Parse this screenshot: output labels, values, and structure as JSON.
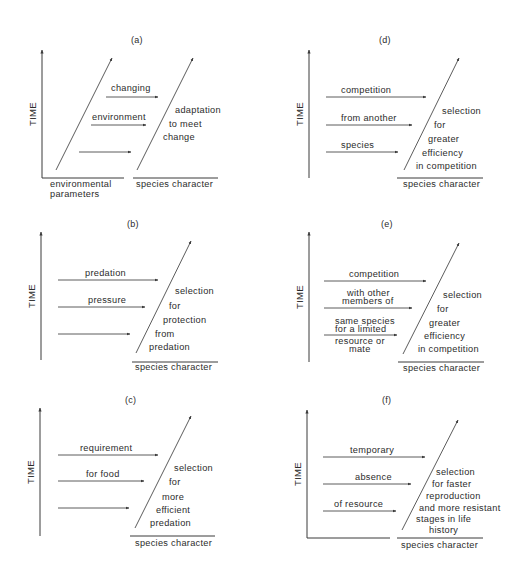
{
  "figure": {
    "panels": [
      {
        "id": "a",
        "label": "(a)",
        "label_pos": [
          131,
          43
        ],
        "axis_label": "TIME",
        "axis": {
          "x": 42,
          "y_top": 50,
          "y_bottom": 178
        },
        "baselines": [
          [
            42,
            178,
            124,
            178
          ],
          [
            133,
            178,
            218,
            178
          ]
        ],
        "diagonals": [
          [
            56,
            170,
            112,
            58
          ],
          [
            137,
            170,
            193,
            58
          ]
        ],
        "arrows": [
          {
            "y": 97,
            "x1": 106,
            "x2": 158,
            "text": "changing",
            "text_x": 111,
            "text_y": 91
          },
          {
            "y": 125,
            "x1": 91,
            "x2": 146,
            "text": "environment",
            "text_x": 92,
            "text_y": 120
          },
          {
            "y": 152,
            "x1": 79,
            "x2": 131,
            "text": "",
            "text_x": 0,
            "text_y": 0
          }
        ],
        "outcome_lines": [
          {
            "text": "adaptation",
            "x": 175,
            "y": 113
          },
          {
            "text": "to meet",
            "x": 169,
            "y": 127
          },
          {
            "text": "change",
            "x": 163,
            "y": 140
          }
        ],
        "x_labels": [
          {
            "text": "environmental",
            "x": 50,
            "y": 187
          },
          {
            "text": "parameters",
            "x": 50,
            "y": 197
          },
          {
            "text": "species character",
            "x": 136,
            "y": 187
          }
        ]
      },
      {
        "id": "b",
        "label": "(b)",
        "label_pos": [
          127,
          227
        ],
        "axis_label": "TIME",
        "axis": {
          "x": 41,
          "y_top": 232,
          "y_bottom": 360
        },
        "baselines": [
          [
            132,
            362,
            218,
            362
          ]
        ],
        "diagonals": [
          [
            136,
            353,
            191,
            241
          ]
        ],
        "arrows": [
          {
            "y": 280,
            "x1": 58,
            "x2": 158,
            "text": "predation",
            "text_x": 85,
            "text_y": 276
          },
          {
            "y": 307,
            "x1": 58,
            "x2": 145,
            "text": "pressure",
            "text_x": 88,
            "text_y": 303
          },
          {
            "y": 334,
            "x1": 58,
            "x2": 130,
            "text": "",
            "text_x": 0,
            "text_y": 0
          }
        ],
        "outcome_lines": [
          {
            "text": "selection",
            "x": 175,
            "y": 294
          },
          {
            "text": "for",
            "x": 169,
            "y": 309
          },
          {
            "text": "protection",
            "x": 163,
            "y": 323
          },
          {
            "text": "from",
            "x": 155,
            "y": 337
          },
          {
            "text": "predation",
            "x": 149,
            "y": 350
          }
        ],
        "x_labels": [
          {
            "text": "species character",
            "x": 135,
            "y": 370
          }
        ]
      },
      {
        "id": "c",
        "label": "(c)",
        "label_pos": [
          125,
          403
        ],
        "axis_label": "TIME",
        "axis": {
          "x": 40,
          "y_top": 408,
          "y_bottom": 536
        },
        "baselines": [
          [
            130,
            536,
            215,
            536
          ]
        ],
        "diagonals": [
          [
            135,
            528,
            191,
            416
          ]
        ],
        "arrows": [
          {
            "y": 455,
            "x1": 58,
            "x2": 158,
            "text": "requirement",
            "text_x": 80,
            "text_y": 451
          },
          {
            "y": 481,
            "x1": 58,
            "x2": 144,
            "text": "for food",
            "text_x": 86,
            "text_y": 477
          },
          {
            "y": 508,
            "x1": 58,
            "x2": 129,
            "text": "",
            "text_x": 0,
            "text_y": 0
          }
        ],
        "outcome_lines": [
          {
            "text": "selection",
            "x": 174,
            "y": 471
          },
          {
            "text": "for",
            "x": 169,
            "y": 485
          },
          {
            "text": "more",
            "x": 162,
            "y": 500
          },
          {
            "text": "efficient",
            "x": 156,
            "y": 513
          },
          {
            "text": "predation",
            "x": 150,
            "y": 526
          }
        ],
        "x_labels": [
          {
            "text": "species character",
            "x": 135,
            "y": 546
          }
        ]
      },
      {
        "id": "d",
        "label": "(d)",
        "label_pos": [
          379,
          43
        ],
        "axis_label": "TIME",
        "axis": {
          "x": 309,
          "y_top": 50,
          "y_bottom": 178
        },
        "baselines": [
          [
            397,
            178,
            483,
            178
          ]
        ],
        "diagonals": [
          [
            404,
            170,
            459,
            58
          ]
        ],
        "arrows": [
          {
            "y": 97,
            "x1": 326,
            "x2": 426,
            "text": "competition",
            "text_x": 341,
            "text_y": 93
          },
          {
            "y": 125,
            "x1": 326,
            "x2": 412,
            "text": "from another",
            "text_x": 341,
            "text_y": 121
          },
          {
            "y": 152,
            "x1": 326,
            "x2": 398,
            "text": "species",
            "text_x": 341,
            "text_y": 148
          }
        ],
        "outcome_lines": [
          {
            "text": "selection",
            "x": 442,
            "y": 114
          },
          {
            "text": "for",
            "x": 434,
            "y": 128
          },
          {
            "text": "greater",
            "x": 428,
            "y": 142
          },
          {
            "text": "efficiency",
            "x": 422,
            "y": 156
          },
          {
            "text": "in competition",
            "x": 416,
            "y": 169
          }
        ],
        "x_labels": [
          {
            "text": "species character",
            "x": 403,
            "y": 187
          }
        ]
      },
      {
        "id": "e",
        "label": "(e)",
        "label_pos": [
          381,
          227
        ],
        "axis_label": "TIME",
        "axis": {
          "x": 309,
          "y_top": 232,
          "y_bottom": 362
        },
        "baselines": [
          [
            398,
            362,
            484,
            362
          ]
        ],
        "diagonals": [
          [
            403,
            354,
            459,
            243
          ]
        ],
        "arrows": [
          {
            "y": 281,
            "x1": 324,
            "x2": 426,
            "text": "competition",
            "text_x": 349,
            "text_y": 277
          },
          {
            "y": 308,
            "x1": 324,
            "x2": 412,
            "text": "with other",
            "text_x": 347,
            "text_y": 296
          },
          {
            "y": 335,
            "x1": 324,
            "x2": 397,
            "text": "same species",
            "text_x": 335,
            "text_y": 324
          }
        ],
        "arrow_sublabels": [
          {
            "text": "members of",
            "x": 342,
            "y": 304
          },
          {
            "text": "for a limited",
            "x": 335,
            "y": 332
          },
          {
            "text": "resource or",
            "x": 335,
            "y": 344
          },
          {
            "text": "mate",
            "x": 349,
            "y": 352
          }
        ],
        "outcome_lines": [
          {
            "text": "selection",
            "x": 443,
            "y": 298
          },
          {
            "text": "for",
            "x": 437,
            "y": 312
          },
          {
            "text": "greater",
            "x": 429,
            "y": 326
          },
          {
            "text": "efficiency",
            "x": 424,
            "y": 339
          },
          {
            "text": "in competition",
            "x": 418,
            "y": 352
          }
        ],
        "x_labels": [
          {
            "text": "species character",
            "x": 403,
            "y": 371
          }
        ]
      },
      {
        "id": "f",
        "label": "(f)",
        "label_pos": [
          382,
          403
        ],
        "axis_label": "TIME",
        "axis": {
          "x": 307,
          "y_top": 410,
          "y_bottom": 538
        },
        "baselines": [
          [
            307,
            538,
            390,
            538
          ],
          [
            397,
            538,
            483,
            538
          ]
        ],
        "diagonals": [
          [
            402,
            530,
            458,
            420
          ]
        ],
        "arrows": [
          {
            "y": 457,
            "x1": 323,
            "x2": 425,
            "text": "temporary",
            "text_x": 350,
            "text_y": 453
          },
          {
            "y": 484,
            "x1": 323,
            "x2": 411,
            "text": "absence",
            "text_x": 355,
            "text_y": 480
          },
          {
            "y": 511,
            "x1": 323,
            "x2": 396,
            "text": "of resource",
            "text_x": 334,
            "text_y": 507
          }
        ],
        "outcome_lines": [
          {
            "text": "selection",
            "x": 436,
            "y": 475
          },
          {
            "text": "for faster",
            "x": 432,
            "y": 487
          },
          {
            "text": "reproduction",
            "x": 426,
            "y": 499
          },
          {
            "text": "and more resistant",
            "x": 419,
            "y": 511
          },
          {
            "text": "stages in life",
            "x": 416,
            "y": 522
          },
          {
            "text": "history",
            "x": 429,
            "y": 533
          }
        ],
        "x_labels": [
          {
            "text": "species character",
            "x": 401,
            "y": 548
          }
        ]
      }
    ]
  }
}
